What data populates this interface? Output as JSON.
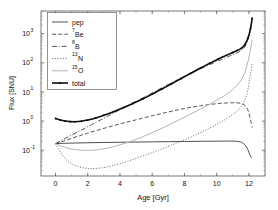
{
  "chart_data": {
    "type": "line",
    "title": "",
    "xlabel": "Age [Gyr]",
    "ylabel": "Flux [SNU]",
    "xlim": [
      -0.9,
      13.0
    ],
    "ylim": [
      0.013,
      6000
    ],
    "yscale": "log",
    "xscale": "linear",
    "grid": false,
    "legend_position": "upper left",
    "xticks": [
      0,
      2,
      4,
      6,
      8,
      10,
      12
    ],
    "xtick_labels": [
      "0",
      "2",
      "4",
      "6",
      "8",
      "10",
      "12"
    ],
    "yticks": [
      0.1,
      1,
      10,
      100,
      1000
    ],
    "ytick_labels": [
      "10⁻¹",
      "10⁰",
      "10¹",
      "10²",
      "10³"
    ],
    "ytick_bases": [
      "10",
      "10",
      "10",
      "10",
      "10"
    ],
    "ytick_exponents": [
      "-1",
      "0",
      "1",
      "2",
      "3"
    ],
    "series": [
      {
        "name": "pep",
        "label": "pep",
        "legend_base": "pep",
        "legend_sup": "",
        "legend_sub": "",
        "style": "solid",
        "color": "#3a3a3a",
        "width": 0.9,
        "dash": "",
        "marker": "none",
        "x": [
          0,
          0.5,
          1,
          2,
          3,
          4,
          5,
          6,
          7,
          8,
          9,
          10,
          10.8,
          11.3,
          11.6,
          11.85,
          12.0,
          12.1,
          12.2
        ],
        "y": [
          0.168,
          0.172,
          0.175,
          0.18,
          0.184,
          0.187,
          0.19,
          0.193,
          0.196,
          0.199,
          0.202,
          0.204,
          0.205,
          0.2,
          0.18,
          0.13,
          0.085,
          0.062,
          0.055
        ]
      },
      {
        "name": "7Be",
        "label": "⁷Be",
        "legend_base": "Be",
        "legend_sup": "7",
        "legend_sub": "",
        "style": "dashed",
        "color": "#3a3a3a",
        "width": 0.85,
        "dash": "4,2.2",
        "marker": "none",
        "x": [
          0,
          0.5,
          1,
          1.5,
          2,
          3,
          4,
          5,
          6,
          7,
          8,
          9,
          10,
          10.5,
          11,
          11.3,
          11.6,
          11.85,
          12.0,
          12.1,
          12.2
        ],
        "y": [
          0.168,
          0.205,
          0.255,
          0.315,
          0.385,
          0.56,
          0.8,
          1.1,
          1.52,
          2.05,
          2.7,
          3.35,
          3.95,
          4.15,
          4.25,
          4.2,
          3.9,
          3.0,
          1.9,
          1.1,
          0.6
        ]
      },
      {
        "name": "8B",
        "label": "⁸B",
        "legend_base": "B",
        "legend_sup": "8",
        "legend_sub": "",
        "style": "dashdot",
        "color": "#3a3a3a",
        "width": 0.85,
        "dash": "5,1.8,1,1.8",
        "marker": "none",
        "x": [
          0,
          0.5,
          1,
          1.5,
          2,
          3,
          4,
          5,
          6,
          7,
          8,
          9,
          10,
          10.5,
          11,
          11.3,
          11.5,
          11.7,
          11.9,
          12.05,
          12.2
        ],
        "y": [
          0.168,
          0.235,
          0.33,
          0.46,
          0.64,
          1.25,
          2.45,
          4.75,
          9.2,
          18.0,
          34.0,
          62.0,
          110.0,
          145.0,
          190.0,
          225.0,
          260.0,
          330.0,
          520.0,
          1100.0,
          2900.0
        ]
      },
      {
        "name": "13N",
        "label": "¹³N",
        "legend_base": "N",
        "legend_sup": "13",
        "legend_sub": "",
        "style": "dotted",
        "color": "#5a5a5a",
        "width": 0.85,
        "dash": "1.1,1.6",
        "marker": "none",
        "x": [
          0,
          0.3,
          0.7,
          1.2,
          1.7,
          2.2,
          2.8,
          3.5,
          4.5,
          5.5,
          6.5,
          7.5,
          8.5,
          9.5,
          10.3,
          11.0,
          11.4,
          11.7,
          11.9,
          12.05,
          12.2
        ],
        "y": [
          0.168,
          0.085,
          0.045,
          0.03,
          0.025,
          0.0235,
          0.0245,
          0.029,
          0.042,
          0.065,
          0.105,
          0.175,
          0.3,
          0.55,
          0.95,
          1.7,
          2.6,
          4.5,
          9.5,
          28.0,
          95.0
        ]
      },
      {
        "name": "15O",
        "label": "¹⁵O",
        "legend_base": "O",
        "legend_sup": "15",
        "legend_sub": "",
        "style": "solid-light",
        "color": "#b4b4b4",
        "width": 1.0,
        "dash": "",
        "marker": "none",
        "x": [
          0,
          0.4,
          0.9,
          1.4,
          1.9,
          2.3,
          2.8,
          3.4,
          4.2,
          5.0,
          6.0,
          7.0,
          8.0,
          9.0,
          10.0,
          10.7,
          11.2,
          11.6,
          11.85,
          12.05,
          12.2
        ],
        "y": [
          0.168,
          0.135,
          0.112,
          0.102,
          0.099,
          0.1,
          0.108,
          0.125,
          0.165,
          0.235,
          0.4,
          0.72,
          1.35,
          2.6,
          5.2,
          9.0,
          15.5,
          30.0,
          70.0,
          200.0,
          620.0
        ]
      },
      {
        "name": "total",
        "label": "total",
        "legend_base": "total",
        "legend_sup": "",
        "legend_sub": "",
        "style": "solid-thick-marker",
        "color": "#0d0d0d",
        "width": 1.6,
        "dash": "",
        "marker": "dot",
        "x": [
          0,
          0.3,
          0.6,
          0.9,
          1.2,
          1.6,
          2.0,
          2.5,
          3.0,
          3.6,
          4.2,
          4.8,
          5.4,
          6.0,
          6.6,
          7.2,
          7.8,
          8.4,
          9.0,
          9.6,
          10.1,
          10.6,
          11.0,
          11.3,
          11.55,
          11.75,
          11.95,
          12.1,
          12.2
        ],
        "y": [
          1.22,
          1.08,
          1.0,
          0.96,
          0.95,
          0.99,
          1.08,
          1.28,
          1.58,
          2.1,
          2.85,
          4.0,
          5.7,
          8.4,
          12.6,
          19.0,
          29.0,
          44.0,
          66.0,
          98.0,
          135.0,
          180.0,
          225.0,
          268.0,
          320.0,
          420.0,
          720.0,
          1500.0,
          3400.0
        ]
      }
    ],
    "legend_entries": [
      "pep",
      "⁷Be",
      "⁸B",
      "¹³N",
      "¹⁵O",
      "total"
    ]
  }
}
